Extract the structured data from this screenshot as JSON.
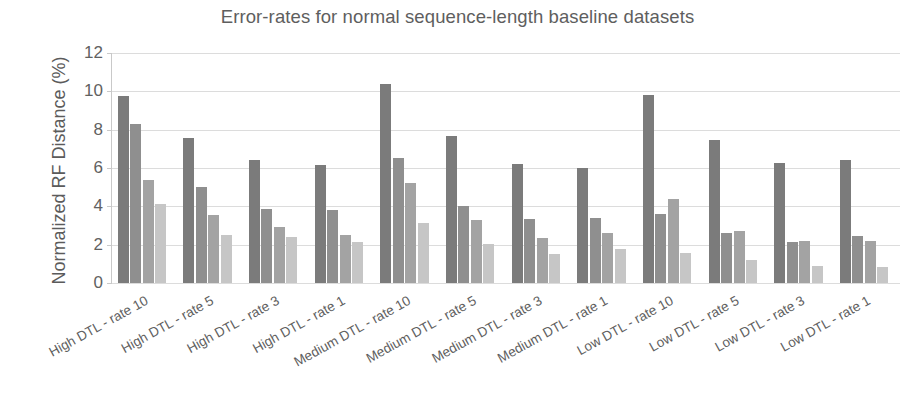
{
  "chart_data": {
    "type": "bar",
    "title": "Error-rates for normal sequence-length baseline datasets",
    "xlabel": "",
    "ylabel": "Normalized RF Distance (%)",
    "ylim": [
      0,
      12
    ],
    "yticks": [
      0,
      2,
      4,
      6,
      8,
      10,
      12
    ],
    "grid": true,
    "legend": "none",
    "categories": [
      "High DTL - rate 10",
      "High DTL - rate 5",
      "High DTL - rate 3",
      "High DTL - rate 1",
      "Medium DTL - rate 10",
      "Medium DTL - rate 5",
      "Medium DTL - rate 3",
      "Medium DTL - rate 1",
      "Low DTL - rate 10",
      "Low DTL - rate 5",
      "Low DTL - rate 3",
      "Low DTL - rate 1"
    ],
    "series": [
      {
        "name": "series-1",
        "color": "#7b7b7b",
        "values": [
          9.75,
          7.55,
          6.4,
          6.15,
          10.4,
          7.65,
          6.2,
          6.0,
          9.8,
          7.45,
          6.25,
          6.4
        ]
      },
      {
        "name": "series-2",
        "color": "#8f8f8f",
        "values": [
          8.3,
          5.0,
          3.85,
          3.8,
          6.5,
          4.0,
          3.35,
          3.4,
          3.6,
          2.6,
          2.15,
          2.45
        ]
      },
      {
        "name": "series-3",
        "color": "#a3a3a3",
        "values": [
          5.4,
          3.55,
          2.9,
          2.5,
          5.2,
          3.3,
          2.35,
          2.6,
          4.4,
          2.7,
          2.2,
          2.2
        ]
      },
      {
        "name": "series-4",
        "color": "#c6c6c6",
        "values": [
          4.1,
          2.5,
          2.4,
          2.15,
          3.15,
          2.05,
          1.5,
          1.8,
          1.55,
          1.2,
          0.9,
          0.85
        ]
      }
    ]
  }
}
